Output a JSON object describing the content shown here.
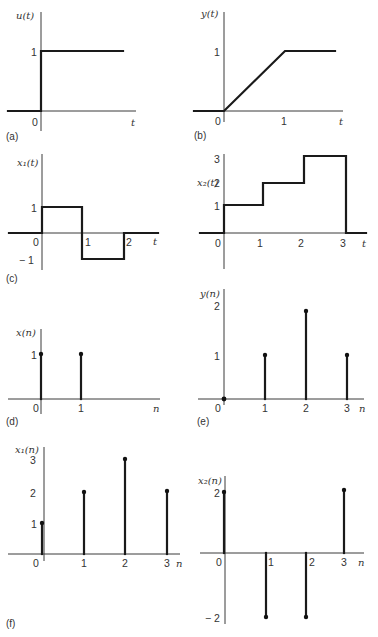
{
  "figure": {
    "panels": [
      {
        "id": "a",
        "caption": "(a)",
        "ylabel": "u(t)",
        "xlabel": "t",
        "yticks": [
          "1"
        ],
        "xticks": [
          "0"
        ],
        "type": "continuous",
        "description": "unit step",
        "points": [
          [
            -1,
            0
          ],
          [
            0,
            0
          ],
          [
            0,
            1
          ],
          [
            2,
            1
          ]
        ]
      },
      {
        "id": "b",
        "caption": "(b)",
        "ylabel": "y(t)",
        "xlabel": "t",
        "yticks": [
          "1"
        ],
        "xticks": [
          "0",
          "1"
        ],
        "type": "continuous",
        "description": "ramp to 1 at t=1 then constant",
        "points": [
          [
            -1,
            0
          ],
          [
            0,
            0
          ],
          [
            1,
            1
          ],
          [
            1.8,
            1
          ]
        ]
      },
      {
        "id": "c",
        "caption": "(c)",
        "ylabel": "x₁(t)",
        "xlabel": "t",
        "yticks": [
          "1",
          "− 1"
        ],
        "xticks": [
          "0",
          "1",
          "2"
        ],
        "type": "continuous",
        "description": "pulse +1 on [0,1], -1 on [1,2]",
        "points": [
          [
            -1,
            0
          ],
          [
            0,
            0
          ],
          [
            0,
            1
          ],
          [
            1,
            1
          ],
          [
            1,
            -1
          ],
          [
            2,
            -1
          ],
          [
            2,
            0
          ],
          [
            2.8,
            0
          ]
        ]
      },
      {
        "id": "c2",
        "caption": "",
        "ylabel": "x₂(t)",
        "xlabel": "t",
        "yticks": [
          "1",
          "2",
          "3"
        ],
        "xticks": [
          "0",
          "1",
          "2",
          "3"
        ],
        "type": "continuous",
        "description": "staircase 1,2,3 on [0,1],[1,2],[2,3]",
        "points": [
          [
            -0.6,
            0
          ],
          [
            0,
            0
          ],
          [
            0,
            1
          ],
          [
            1,
            1
          ],
          [
            1,
            2
          ],
          [
            2,
            2
          ],
          [
            2,
            3
          ],
          [
            3,
            3
          ],
          [
            3,
            0
          ],
          [
            3.5,
            0
          ]
        ]
      },
      {
        "id": "d",
        "caption": "(d)",
        "ylabel": "x(n)",
        "xlabel": "n",
        "yticks": [
          "1"
        ],
        "xticks": [
          "0",
          "1"
        ],
        "type": "stem",
        "n": [
          0,
          1
        ],
        "values": [
          1,
          1
        ]
      },
      {
        "id": "e",
        "caption": "(e)",
        "ylabel": "y(n)",
        "xlabel": "n",
        "yticks": [
          "1",
          "2"
        ],
        "xticks": [
          "0",
          "1",
          "2",
          "3"
        ],
        "type": "stem",
        "n": [
          0,
          1,
          2,
          3
        ],
        "values": [
          0,
          1,
          2,
          1
        ]
      },
      {
        "id": "f",
        "caption": "(f)",
        "ylabel": "x₁(n)",
        "xlabel": "n",
        "yticks": [
          "1",
          "2",
          "3"
        ],
        "xticks": [
          "0",
          "1",
          "2",
          "3"
        ],
        "type": "stem",
        "n": [
          0,
          1,
          2,
          3
        ],
        "values": [
          1,
          2,
          3,
          2
        ]
      },
      {
        "id": "f2",
        "caption": "",
        "ylabel": "x₂(n)",
        "xlabel": "n",
        "yticks": [
          "2",
          "− 2"
        ],
        "xticks": [
          "0",
          "1",
          "2",
          "3"
        ],
        "type": "stem",
        "n": [
          0,
          1,
          2,
          3
        ],
        "values": [
          2,
          -2,
          -2,
          2
        ]
      }
    ]
  }
}
